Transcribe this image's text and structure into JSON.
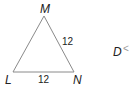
{
  "diagram": {
    "type": "triangle",
    "vertices": [
      {
        "name": "M",
        "x": 44,
        "y": 16
      },
      {
        "name": "L",
        "x": 13,
        "y": 72
      },
      {
        "name": "N",
        "x": 74,
        "y": 72
      }
    ],
    "side_labels": {
      "MN": "12",
      "LN": "12"
    },
    "partial_label": {
      "text": "D",
      "glyph": "<"
    },
    "colors": {
      "stroke": "#8a8a8a",
      "text": "#222222"
    }
  }
}
